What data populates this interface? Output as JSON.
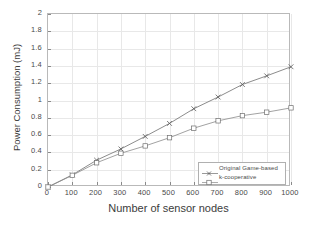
{
  "chart_data": {
    "type": "line",
    "title": "",
    "xlabel": "Number of sensor nodes",
    "ylabel": "Power Consumption (mJ)",
    "xlim": [
      0,
      1000
    ],
    "ylim": [
      0,
      2
    ],
    "xticks": [
      0,
      100,
      200,
      300,
      400,
      500,
      600,
      700,
      800,
      900,
      1000
    ],
    "xtick_labels": [
      "0",
      "100",
      "200",
      "300",
      "400",
      "500",
      "600",
      "700",
      "800",
      "900",
      "1000"
    ],
    "yticks": [
      0,
      0.2,
      0.4,
      0.6,
      0.8,
      1,
      1.2,
      1.4,
      1.6,
      1.8,
      2
    ],
    "ytick_labels": [
      "0",
      "0.2",
      "0.4",
      "0.6",
      "0.8",
      "1",
      "1.2",
      "1.4",
      "1.6",
      "1.8",
      "2"
    ],
    "grid": true,
    "legend_position": "lower right",
    "x": [
      0,
      100,
      200,
      300,
      400,
      500,
      600,
      700,
      800,
      900,
      1000
    ],
    "series": [
      {
        "name": "Original Game-based",
        "marker": "x-marker",
        "color": "#6e6e6e",
        "values": [
          0,
          0.14,
          0.31,
          0.44,
          0.585,
          0.735,
          0.905,
          1.04,
          1.185,
          1.285,
          1.39
        ]
      },
      {
        "name": "k-cooperative",
        "marker": "square-marker",
        "color": "#8a8a8a",
        "values": [
          0,
          0.135,
          0.28,
          0.39,
          0.475,
          0.57,
          0.68,
          0.765,
          0.825,
          0.865,
          0.915
        ]
      }
    ]
  },
  "legend": {
    "entries": [
      {
        "label": "Original Game-based"
      },
      {
        "label": "k-cooperative"
      }
    ]
  },
  "colors": {
    "axis": "#b9b9b9",
    "grid": "#e8e8e8",
    "text": "#4a4a4a",
    "series_1": "#6e6e6e",
    "series_2": "#8a8a8a"
  }
}
